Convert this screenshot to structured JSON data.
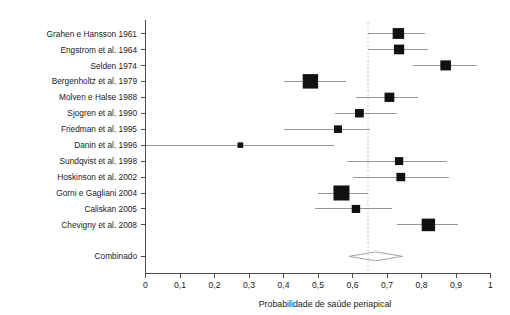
{
  "figure": {
    "axis_title": "Probabilidade de saúde periapical",
    "summary_row_label": "Combinado",
    "colors": {
      "marker": "#111111",
      "ci_line": "#8c8c8c",
      "axis": "#4d4d4d",
      "reference_line": "#b0b0b0",
      "background": "#ffffff"
    }
  },
  "chart_data": {
    "type": "scatter",
    "subtype": "forest-plot",
    "title": "",
    "xlabel": "Probabilidade de saúde periapical",
    "ylabel": "",
    "xlim": [
      0,
      1
    ],
    "xticks": [
      0,
      0.1,
      0.2,
      0.3,
      0.4,
      0.5,
      0.6,
      0.7,
      0.8,
      0.9,
      1
    ],
    "xtick_labels": [
      "0",
      "0,1",
      "0,2",
      "0,3",
      "0,4",
      "0,5",
      "0,6",
      "0,7",
      "0,8",
      "0,9",
      "1"
    ],
    "grid": false,
    "legend": false,
    "reference_line": 0.645,
    "categories": [
      "Grahen e Hansson 1961",
      "Engstrom et al. 1964",
      "Selden 1974",
      "Bergenholtz et al. 1979",
      "Molven e Halse 1988",
      "Sjogren et al. 1990",
      "Friedman et al. 1995",
      "Danin et al. 1996",
      "Sundqvist et al. 1998",
      "Hoskinson et al. 2002",
      "Gorni e Gagliani 2004",
      "Caliskan 2005",
      "Chevigny et al. 2008"
    ],
    "studies": [
      {
        "label": "Grahen e Hansson 1961",
        "estimate": 0.733,
        "ci_low": 0.645,
        "ci_high": 0.81,
        "weight": 0.62
      },
      {
        "label": "Engstrom et al. 1964",
        "estimate": 0.735,
        "ci_low": 0.645,
        "ci_high": 0.82,
        "weight": 0.52
      },
      {
        "label": "Selden 1974",
        "estimate": 0.87,
        "ci_low": 0.775,
        "ci_high": 0.96,
        "weight": 0.55
      },
      {
        "label": "Bergenholtz et al. 1979",
        "estimate": 0.478,
        "ci_low": 0.4,
        "ci_high": 0.58,
        "weight": 0.95
      },
      {
        "label": "Molven e Halse 1988",
        "estimate": 0.707,
        "ci_low": 0.61,
        "ci_high": 0.79,
        "weight": 0.48
      },
      {
        "label": "Sjogren et al. 1990",
        "estimate": 0.62,
        "ci_low": 0.548,
        "ci_high": 0.73,
        "weight": 0.4
      },
      {
        "label": "Friedman et al. 1995",
        "estimate": 0.558,
        "ci_low": 0.4,
        "ci_high": 0.65,
        "weight": 0.33
      },
      {
        "label": "Danin et al. 1996",
        "estimate": 0.275,
        "ci_low": 0.0,
        "ci_high": 0.545,
        "weight": 0.14
      },
      {
        "label": "Sundqvist et al. 1998",
        "estimate": 0.735,
        "ci_low": 0.585,
        "ci_high": 0.875,
        "weight": 0.36
      },
      {
        "label": "Hoskinson et al. 2002",
        "estimate": 0.74,
        "ci_low": 0.6,
        "ci_high": 0.88,
        "weight": 0.4
      },
      {
        "label": "Gorni e Gagliani 2004",
        "estimate": 0.568,
        "ci_low": 0.5,
        "ci_high": 0.645,
        "weight": 1.0
      },
      {
        "label": "Caliskan 2005",
        "estimate": 0.61,
        "ci_low": 0.49,
        "ci_high": 0.715,
        "weight": 0.37
      },
      {
        "label": "Chevigny et al. 2008",
        "estimate": 0.82,
        "ci_low": 0.73,
        "ci_high": 0.905,
        "weight": 0.78
      }
    ],
    "summary": {
      "label": "Combinado",
      "estimate": 0.667,
      "ci_low": 0.59,
      "ci_high": 0.745
    }
  }
}
